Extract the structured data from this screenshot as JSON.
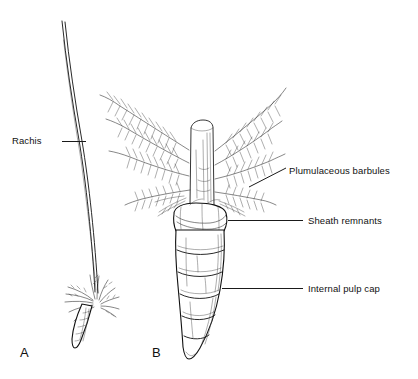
{
  "figure": {
    "background_color": "#ffffff",
    "ink_color": "#111111",
    "width": 418,
    "height": 379
  },
  "panels": [
    {
      "letter": "A",
      "name": "whole-feather",
      "description": "Whole feather with long curved rachis and tuft of barbs at the base"
    },
    {
      "letter": "B",
      "name": "feather-base-detail",
      "description": "Enlarged feather base showing plumulaceous barbules, sheath remnants and segmented calamus with internal pulp caps"
    }
  ],
  "labels": [
    {
      "id": "rachis",
      "text": "Rachis",
      "text_x": 12,
      "text_y": 144,
      "leader": {
        "x1": 62,
        "y1": 141,
        "x2": 86,
        "y2": 141
      },
      "panel": "A"
    },
    {
      "id": "plumulaceous-barbules",
      "text": "Plumulaceous barbules",
      "text_x": 289,
      "text_y": 174,
      "leader": {
        "x1": 249,
        "y1": 187,
        "x2": 286,
        "y2": 168
      },
      "panel": "B"
    },
    {
      "id": "sheath-remnants",
      "text": "Sheath remnants",
      "text_x": 308,
      "text_y": 224,
      "leader": {
        "x1": 228,
        "y1": 220,
        "x2": 303,
        "y2": 220
      },
      "panel": "B"
    },
    {
      "id": "internal-pulp-cap",
      "text": "Internal pulp cap",
      "text_x": 308,
      "text_y": 292,
      "leader": {
        "x1": 222,
        "y1": 288,
        "x2": 303,
        "y2": 288
      },
      "panel": "B"
    }
  ],
  "panel_letters": [
    {
      "text": "A",
      "x": 20,
      "y": 357
    },
    {
      "text": "B",
      "x": 152,
      "y": 357
    }
  ]
}
